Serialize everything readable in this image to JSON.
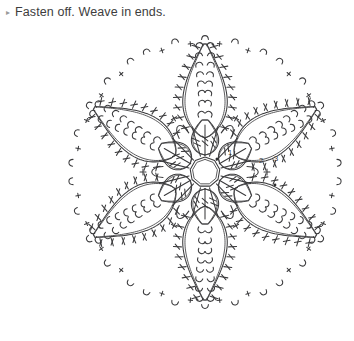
{
  "instruction": {
    "bullet": "▸",
    "text": "Fasten off. Weave in ends."
  },
  "diagram": {
    "name": "crochet-snowflake-chart",
    "type": "crochet-stitch-diagram",
    "center": {
      "x": 205,
      "y": 172
    },
    "ring_radius": 15,
    "petal_count": 6,
    "petal_angles_deg": [
      0,
      60,
      120,
      180,
      240,
      300
    ],
    "colors": {
      "stroke": "#3a3a3c",
      "text": "#3d3d3d",
      "bullet": "#9a9a9a",
      "background": "#ffffff"
    },
    "round_labels": [
      {
        "text": "1",
        "x": 228,
        "y": 155
      },
      {
        "text": "2",
        "x": 259,
        "y": 163
      },
      {
        "text": "3",
        "x": 274,
        "y": 161
      }
    ],
    "legend_symbols": [
      {
        "name": "chain-loop",
        "glyph": "∩"
      },
      {
        "name": "single-crochet",
        "glyph": "+"
      },
      {
        "name": "double-crochet",
        "glyph": "†"
      },
      {
        "name": "magic-ring",
        "glyph": "○"
      }
    ],
    "petal": {
      "inner_start": 34,
      "tip": 128,
      "half_width": 26,
      "sc_marks": 9,
      "picot_arcs": 8
    },
    "center_flower": {
      "lobes": 6,
      "lobe_radius": 52,
      "spokes_per_lobe": 3
    }
  }
}
